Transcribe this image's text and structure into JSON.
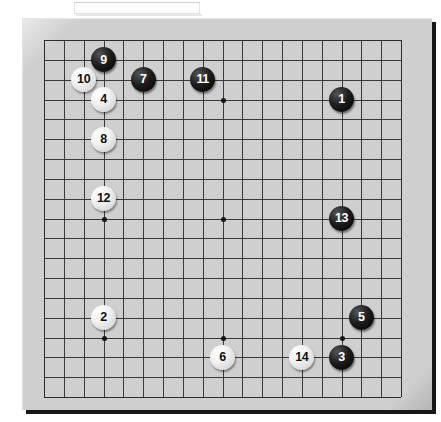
{
  "app": {
    "view_name": "go-board-diagram",
    "board_size": 19,
    "board_color": "#cfcfcf",
    "line_color": "#3a3a3a",
    "black_stone_color": "#000000",
    "white_stone_color": "#f2f2f2"
  },
  "top_strip": {
    "label": ""
  },
  "board": {
    "caption": "",
    "star_points": [
      {
        "col": 3,
        "row": 3
      },
      {
        "col": 9,
        "row": 3
      },
      {
        "col": 15,
        "row": 3
      },
      {
        "col": 3,
        "row": 9
      },
      {
        "col": 9,
        "row": 9
      },
      {
        "col": 15,
        "row": 9
      },
      {
        "col": 3,
        "row": 15
      },
      {
        "col": 9,
        "row": 15
      },
      {
        "col": 15,
        "row": 15
      }
    ],
    "moves": [
      {
        "number": "1",
        "color": "black",
        "col": 15,
        "row": 3
      },
      {
        "number": "2",
        "color": "white",
        "col": 3,
        "row": 14
      },
      {
        "number": "3",
        "color": "black",
        "col": 15,
        "row": 16
      },
      {
        "number": "4",
        "color": "white",
        "col": 3,
        "row": 3
      },
      {
        "number": "5",
        "color": "black",
        "col": 16,
        "row": 14
      },
      {
        "number": "6",
        "color": "white",
        "col": 9,
        "row": 16
      },
      {
        "number": "7",
        "color": "black",
        "col": 5,
        "row": 2
      },
      {
        "number": "8",
        "color": "white",
        "col": 3,
        "row": 5
      },
      {
        "number": "9",
        "color": "black",
        "col": 3,
        "row": 1
      },
      {
        "number": "10",
        "color": "white",
        "col": 2,
        "row": 2
      },
      {
        "number": "11",
        "color": "black",
        "col": 8,
        "row": 2
      },
      {
        "number": "12",
        "color": "white",
        "col": 3,
        "row": 8
      },
      {
        "number": "13",
        "color": "black",
        "col": 15,
        "row": 9
      },
      {
        "number": "14",
        "color": "white",
        "col": 13,
        "row": 16
      }
    ]
  }
}
